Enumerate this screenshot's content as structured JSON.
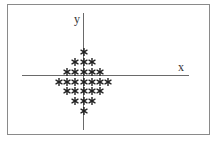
{
  "diagram": {
    "x_label": "x",
    "y_label": "y",
    "marker": "asterisk",
    "rows": [
      {
        "y": 1.5,
        "count": 1
      },
      {
        "y": 1.0,
        "count": 3
      },
      {
        "y": 0.5,
        "count": 5
      },
      {
        "y": 0.0,
        "count": 7
      },
      {
        "y": -0.5,
        "count": 5
      },
      {
        "y": -1.0,
        "count": 3
      },
      {
        "y": -1.5,
        "count": 1
      }
    ],
    "shape": "diamond of asterisks centered on origin"
  },
  "chart_data": {
    "type": "scatter",
    "title": "",
    "xlabel": "x",
    "ylabel": "y",
    "grid": false,
    "marker": "*",
    "row_counts": [
      1,
      3,
      5,
      7,
      5,
      3,
      1
    ],
    "points": [
      [
        0,
        3
      ],
      [
        -1,
        2
      ],
      [
        0,
        2
      ],
      [
        1,
        2
      ],
      [
        -2,
        1
      ],
      [
        -1,
        1
      ],
      [
        0,
        1
      ],
      [
        1,
        1
      ],
      [
        2,
        1
      ],
      [
        -3,
        0
      ],
      [
        -2,
        0
      ],
      [
        -1,
        0
      ],
      [
        0,
        0
      ],
      [
        1,
        0
      ],
      [
        2,
        0
      ],
      [
        3,
        0
      ],
      [
        -2,
        -1
      ],
      [
        -1,
        -1
      ],
      [
        0,
        -1
      ],
      [
        1,
        -1
      ],
      [
        2,
        -1
      ],
      [
        -1,
        -2
      ],
      [
        0,
        -2
      ],
      [
        1,
        -2
      ],
      [
        0,
        -3
      ]
    ]
  }
}
